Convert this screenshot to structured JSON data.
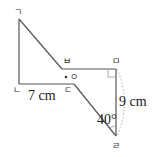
{
  "figure": {
    "vertices": {
      "g": "ㄱ",
      "n": "ㄴ",
      "d": "ㄷ",
      "r": "ㄹ",
      "m": "ㅁ",
      "b": "ㅂ"
    },
    "center_point_label": "ㅇ",
    "length_ND": "7 cm",
    "length_MR": "9 cm",
    "angle_at_R": "40°"
  },
  "colors": {
    "line": "#555555",
    "auxiliary": "#aaaaaa",
    "text": "#222222"
  }
}
